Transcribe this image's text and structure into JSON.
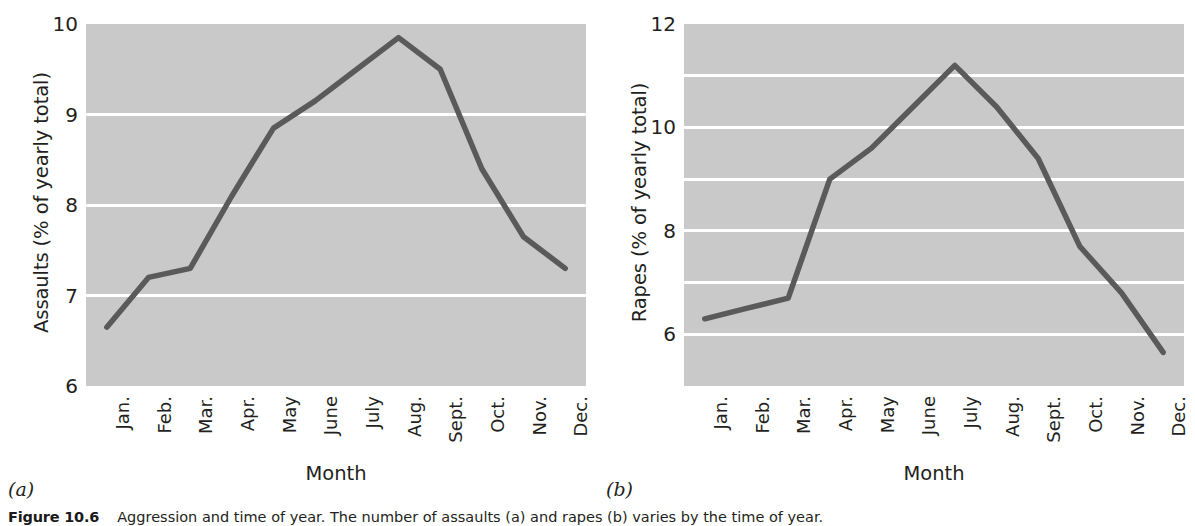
{
  "figure": {
    "caption_number": "Figure 10.6",
    "caption_text": "Aggression and time of year. The number of assaults (a) and rapes (b) varies by the time of year.",
    "panel_a_letter": "(a)",
    "panel_b_letter": "(b)"
  },
  "chart_data": [
    {
      "type": "line",
      "panel": "a",
      "title": "",
      "xlabel": "Month",
      "ylabel": "Assaults (% of yearly total)",
      "categories": [
        "Jan.",
        "Feb.",
        "Mar.",
        "Apr.",
        "May",
        "June",
        "July",
        "Aug.",
        "Sept.",
        "Oct.",
        "Nov.",
        "Dec."
      ],
      "values": [
        6.65,
        7.2,
        7.3,
        8.1,
        8.85,
        9.15,
        9.5,
        9.85,
        9.5,
        8.4,
        7.65,
        7.3
      ],
      "ylim": [
        6,
        10
      ],
      "ytick_labels": [
        "6",
        "7",
        "8",
        "9",
        "10"
      ],
      "ytick_values": [
        6,
        7,
        8,
        9,
        10
      ],
      "gridlines": [
        7,
        8,
        9
      ],
      "grid": true,
      "legend": "none",
      "line_color": "#5a5a5a",
      "plot_background": "#c9c9c9",
      "grid_color": "#ffffff"
    },
    {
      "type": "line",
      "panel": "b",
      "title": "",
      "xlabel": "Month",
      "ylabel": "Rapes (% of yearly total)",
      "categories": [
        "Jan.",
        "Feb.",
        "Mar.",
        "Apr.",
        "May",
        "June",
        "July",
        "Aug.",
        "Sept.",
        "Oct.",
        "Nov.",
        "Dec."
      ],
      "values": [
        6.3,
        6.5,
        6.7,
        9.0,
        9.6,
        10.4,
        11.2,
        10.4,
        9.4,
        7.7,
        6.8,
        5.65
      ],
      "ylim": [
        5,
        12
      ],
      "ytick_labels": [
        "6",
        "8",
        "10",
        "12"
      ],
      "ytick_values": [
        6,
        8,
        10,
        12
      ],
      "gridlines": [
        6,
        7,
        8,
        9,
        10,
        11
      ],
      "grid": true,
      "legend": "none",
      "line_color": "#5a5a5a",
      "plot_background": "#c9c9c9",
      "grid_color": "#ffffff"
    }
  ]
}
